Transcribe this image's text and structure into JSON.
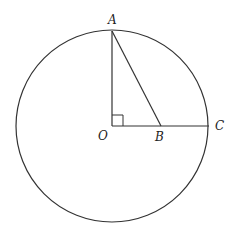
{
  "diagram": {
    "labels": {
      "A": "A",
      "O": "O",
      "B": "B",
      "C": "C"
    },
    "colors": {
      "stroke": "#333333",
      "background": "#ffffff"
    }
  }
}
